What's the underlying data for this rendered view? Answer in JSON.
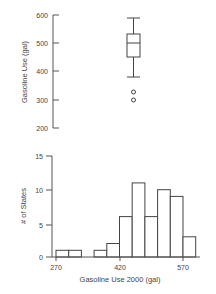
{
  "chart_data": [
    {
      "type": "boxplot",
      "title": "",
      "xlabel": "",
      "ylabel": "Gasoline Use (gal)",
      "ylim": [
        200,
        600
      ],
      "yticks": [
        200,
        300,
        400,
        500,
        600
      ],
      "grid": false,
      "stats": {
        "whisker_high": 590,
        "q3": 533,
        "median": 500,
        "q1": 451,
        "whisker_low": 380,
        "outliers": [
          327,
          300
        ]
      }
    },
    {
      "type": "histogram",
      "title": "",
      "xlabel": "Gasoline Use 2000 (gal)",
      "ylabel": "# of States",
      "xticks": [
        270,
        420,
        570
      ],
      "yticks": [
        0,
        5,
        10,
        15
      ],
      "ylim": [
        0,
        15
      ],
      "grid": false,
      "bin_width": 30,
      "categories": [
        "270-300",
        "300-330",
        "330-360",
        "360-390",
        "390-420",
        "420-450",
        "450-480",
        "480-510",
        "510-540",
        "540-570",
        "570-600"
      ],
      "bin_starts": [
        270,
        300,
        330,
        360,
        390,
        420,
        450,
        480,
        510,
        540,
        570
      ],
      "values": [
        1,
        1,
        0,
        1,
        2,
        6,
        11,
        6,
        10,
        9,
        3
      ]
    }
  ],
  "labels": {
    "box_ylabel": "Gasoline Use (gal)",
    "box_ticks": [
      "600",
      "500",
      "400",
      "300",
      "200"
    ],
    "hist_ylabel": "# of States",
    "hist_yticks": [
      "15",
      "10",
      "5",
      "0"
    ],
    "hist_xticks": [
      "270",
      "420",
      "570"
    ],
    "hist_xlabel": "Gasoline Use 2000 (gal)"
  }
}
